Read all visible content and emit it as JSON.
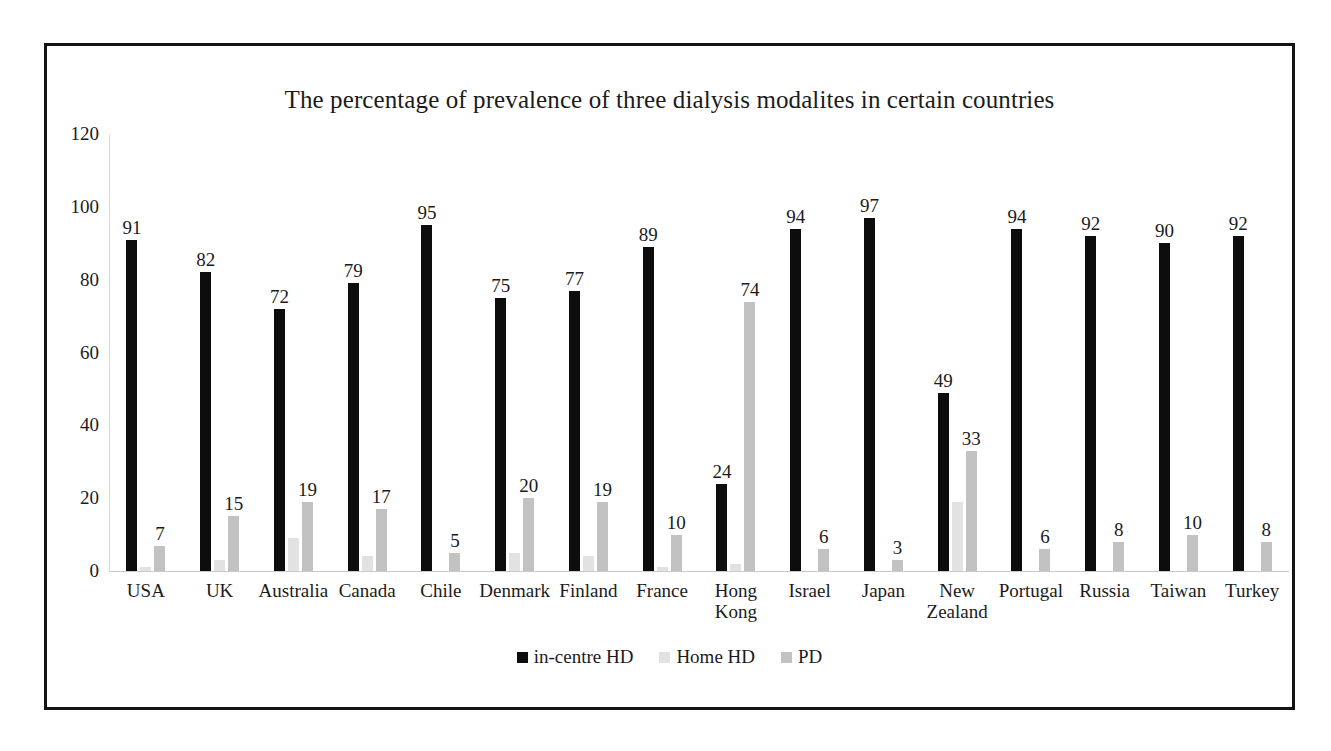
{
  "chart_data": {
    "type": "bar",
    "title": "The percentage of prevalence of three dialysis modalites in certain countries",
    "xlabel": "",
    "ylabel": "",
    "ylim": [
      0,
      120
    ],
    "yticks": [
      "0",
      "20",
      "40",
      "60",
      "80",
      "100",
      "120"
    ],
    "grid": false,
    "legend_position": "bottom",
    "categories": [
      "USA",
      "UK",
      "Australia",
      "Canada",
      "Chile",
      "Denmark",
      "Finland",
      "France",
      "Hong Kong",
      "Israel",
      "Japan",
      "New Zealand",
      "Portugal",
      "Russia",
      "Taiwan",
      "Turkey"
    ],
    "series": [
      {
        "name": "in-centre HD",
        "color": "#0d0d0d",
        "values": [
          91,
          82,
          72,
          79,
          95,
          75,
          77,
          89,
          24,
          94,
          97,
          49,
          94,
          92,
          90,
          92
        ],
        "labels": [
          "91",
          "82",
          "72",
          "79",
          "95",
          "75",
          "77",
          "89",
          "24",
          "94",
          "97",
          "49",
          "94",
          "92",
          "90",
          "92"
        ]
      },
      {
        "name": "Home HD",
        "color": "#e2e2e2",
        "values": [
          1,
          3,
          9,
          4,
          0,
          5,
          4,
          1,
          2,
          0,
          0,
          19,
          0,
          0,
          0,
          0
        ],
        "labels": [
          "",
          "",
          "",
          "",
          "",
          "",
          "",
          "",
          "",
          "",
          "",
          "",
          "",
          "",
          "",
          ""
        ]
      },
      {
        "name": "PD",
        "color": "#c2c2c2",
        "values": [
          7,
          15,
          19,
          17,
          5,
          20,
          19,
          10,
          74,
          6,
          3,
          33,
          6,
          8,
          10,
          8
        ],
        "labels": [
          "7",
          "15",
          "19",
          "17",
          "5",
          "20",
          "19",
          "10",
          "74",
          "6",
          "3",
          "33",
          "6",
          "8",
          "10",
          "8"
        ]
      }
    ]
  },
  "legend": {
    "items": [
      {
        "label": "in-centre HD",
        "color": "#0d0d0d"
      },
      {
        "label": "Home HD",
        "color": "#e2e2e2"
      },
      {
        "label": "PD",
        "color": "#c2c2c2"
      }
    ]
  }
}
